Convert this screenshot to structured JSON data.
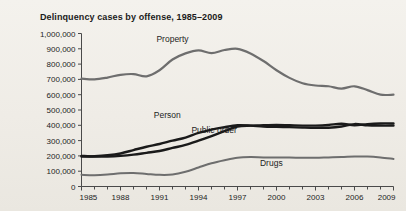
{
  "figure": {
    "title": "Delinquency cases by offense, 1985–2009",
    "background_color": "#f1eee8",
    "axis_color": "#4a4a4a",
    "text_color": "#1d1d1d"
  },
  "chart_data": {
    "type": "line",
    "title": "Delinquency cases by offense, 1985–2009",
    "xlabel": "",
    "ylabel": "",
    "xlim": [
      1985,
      2009
    ],
    "ylim": [
      0,
      1000000
    ],
    "grid": false,
    "legend_position": "inline-labels",
    "x": [
      1985,
      1986,
      1987,
      1988,
      1989,
      1990,
      1991,
      1992,
      1993,
      1994,
      1995,
      1996,
      1997,
      1998,
      1999,
      2000,
      2001,
      2002,
      2003,
      2004,
      2005,
      2006,
      2007,
      2008,
      2009
    ],
    "y_ticks": [
      0,
      100000,
      200000,
      300000,
      400000,
      500000,
      600000,
      700000,
      800000,
      900000,
      1000000
    ],
    "y_tick_labels": [
      "0",
      "100,000",
      "200,000",
      "300,000",
      "400,000",
      "500,000",
      "600,000",
      "700,000",
      "800,000",
      "900,000",
      "1,000,000"
    ],
    "x_ticks_labeled": [
      1985,
      1988,
      1991,
      1994,
      1997,
      2000,
      2003,
      2006,
      2009
    ],
    "x_tick_labels": [
      "1985",
      "1988",
      "1991",
      "1994",
      "1997",
      "2000",
      "2003",
      "2006",
      "2009"
    ],
    "series": [
      {
        "name": "Property",
        "color": "#6e6e6e",
        "width": 2.2,
        "label_x": 1992,
        "label_y": 945000,
        "values": [
          705000,
          700000,
          712000,
          730000,
          735000,
          720000,
          760000,
          830000,
          870000,
          890000,
          872000,
          892000,
          900000,
          870000,
          820000,
          760000,
          710000,
          675000,
          660000,
          655000,
          640000,
          655000,
          630000,
          600000,
          600000
        ]
      },
      {
        "name": "Person",
        "color": "#1a1a1a",
        "width": 2.4,
        "label_x": 1991.6,
        "label_y": 448000,
        "values": [
          196000,
          198000,
          204000,
          216000,
          238000,
          260000,
          278000,
          300000,
          320000,
          350000,
          372000,
          388000,
          400000,
          398000,
          392000,
          390000,
          388000,
          385000,
          383000,
          384000,
          392000,
          408000,
          400000,
          398000,
          398000
        ]
      },
      {
        "name": "Public order",
        "color": "#1a1a1a",
        "width": 2.4,
        "label_x": 1995.2,
        "label_y": 348000,
        "values": [
          200000,
          196000,
          196000,
          200000,
          208000,
          220000,
          232000,
          252000,
          272000,
          300000,
          330000,
          362000,
          392000,
          398000,
          400000,
          402000,
          400000,
          398000,
          398000,
          402000,
          410000,
          400000,
          408000,
          412000,
          412000
        ]
      },
      {
        "name": "Drugs",
        "color": "#6e6e6e",
        "width": 2.0,
        "label_x": 1999.6,
        "label_y": 132000,
        "values": [
          76000,
          74000,
          78000,
          86000,
          88000,
          82000,
          76000,
          78000,
          96000,
          124000,
          152000,
          172000,
          188000,
          192000,
          190000,
          190000,
          189000,
          188000,
          188000,
          190000,
          192000,
          196000,
          196000,
          190000,
          180000
        ]
      }
    ]
  }
}
